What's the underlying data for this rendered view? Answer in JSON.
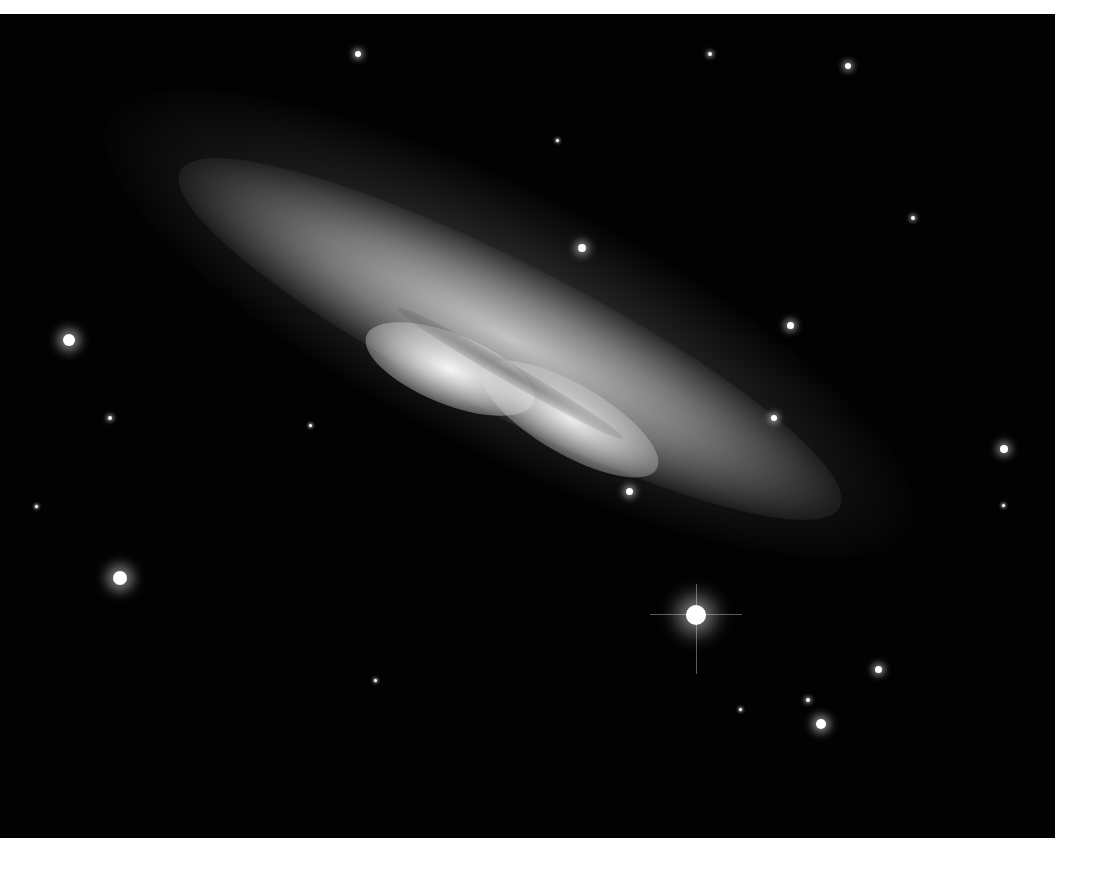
{
  "image": {
    "subject": "edge-on starburst galaxy with surrounding field stars",
    "palette": {
      "background": "#020202",
      "margin": "#ffffff",
      "galaxy_core": "#f4f4f4",
      "galaxy_halo": "#5a5a5a"
    }
  },
  "galaxy": {
    "center_x": 500,
    "center_y": 375,
    "angle_deg": 27
  },
  "stars": [
    {
      "x": 358,
      "y": 54,
      "r": 3
    },
    {
      "x": 710,
      "y": 54,
      "r": 2
    },
    {
      "x": 848,
      "y": 66,
      "r": 3
    },
    {
      "x": 557,
      "y": 140,
      "r": 1.5
    },
    {
      "x": 913,
      "y": 218,
      "r": 2
    },
    {
      "x": 582,
      "y": 248,
      "r": 4
    },
    {
      "x": 69,
      "y": 340,
      "r": 6
    },
    {
      "x": 790,
      "y": 325,
      "r": 3.5
    },
    {
      "x": 110,
      "y": 418,
      "r": 2
    },
    {
      "x": 774,
      "y": 418,
      "r": 3
    },
    {
      "x": 1004,
      "y": 449,
      "r": 4
    },
    {
      "x": 629,
      "y": 491,
      "r": 3.5
    },
    {
      "x": 120,
      "y": 578,
      "r": 7
    },
    {
      "x": 696,
      "y": 615,
      "r": 10
    },
    {
      "x": 878,
      "y": 669,
      "r": 3.5
    },
    {
      "x": 808,
      "y": 700,
      "r": 2
    },
    {
      "x": 821,
      "y": 724,
      "r": 5
    },
    {
      "x": 740,
      "y": 709,
      "r": 1.5
    },
    {
      "x": 36,
      "y": 506,
      "r": 1.5
    },
    {
      "x": 375,
      "y": 680,
      "r": 1.5
    },
    {
      "x": 310,
      "y": 425,
      "r": 1.5
    },
    {
      "x": 1003,
      "y": 505,
      "r": 1.5
    }
  ]
}
